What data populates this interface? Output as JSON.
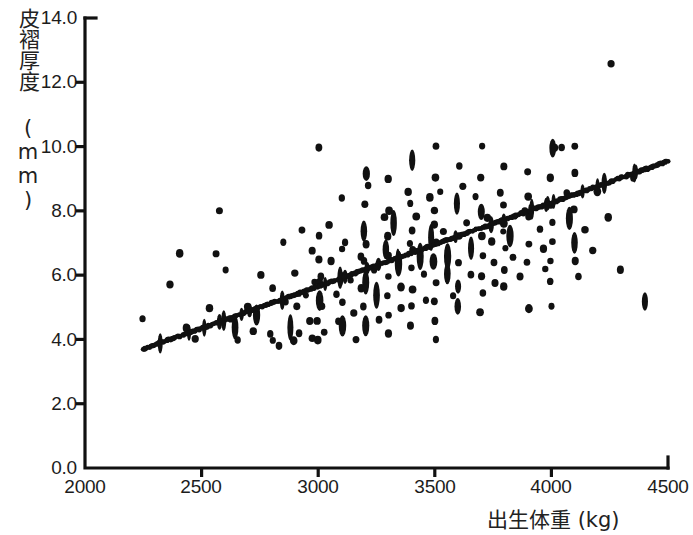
{
  "chart_data": {
    "type": "scatter",
    "title": "",
    "subtitle": "",
    "xlabel": "出生体重 (kg)",
    "ylabel": "皮褶厚度 (mm)",
    "xlim": [
      2000,
      4500
    ],
    "ylim": [
      0.0,
      14.0
    ],
    "xticks": [
      2000,
      2500,
      3000,
      3500,
      4000,
      4500
    ],
    "xtick_labels": [
      "2000",
      "2500",
      "3000",
      "3500",
      "4000",
      "4500"
    ],
    "yticks": [
      0.0,
      2.0,
      4.0,
      6.0,
      8.0,
      10.0,
      12.0,
      14.0
    ],
    "ytick_labels": [
      "0.0",
      "2.0",
      "4.0",
      "6.0",
      "8.0",
      "10.0",
      "12.0",
      "14.0"
    ],
    "grid": false,
    "legend": null,
    "marker_color": "#111111",
    "line_color": "#111111",
    "background_color": "#ffffff",
    "axis_color": "#111111",
    "series": [
      {
        "name": "観測値",
        "type": "scatter",
        "points": [
          [
            2250,
            4.6
          ],
          [
            2370,
            5.7
          ],
          [
            2400,
            6.7
          ],
          [
            2430,
            4.4
          ],
          [
            2470,
            4.0
          ],
          [
            2530,
            5.0
          ],
          [
            2560,
            6.7
          ],
          [
            2570,
            8.0
          ],
          [
            2600,
            6.2
          ],
          [
            2620,
            4.6
          ],
          [
            2640,
            4.4
          ],
          [
            2660,
            4.0
          ],
          [
            2700,
            5.0
          ],
          [
            2720,
            4.3
          ],
          [
            2740,
            4.8
          ],
          [
            2760,
            6.0
          ],
          [
            2790,
            4.2
          ],
          [
            2800,
            5.6
          ],
          [
            2810,
            4.0
          ],
          [
            2830,
            3.8
          ],
          [
            2850,
            7.0
          ],
          [
            2860,
            5.2
          ],
          [
            2880,
            4.4
          ],
          [
            2890,
            4.0
          ],
          [
            2900,
            6.1
          ],
          [
            2910,
            5.0
          ],
          [
            2920,
            4.2
          ],
          [
            2930,
            7.4
          ],
          [
            2950,
            5.4
          ],
          [
            2960,
            4.6
          ],
          [
            2970,
            4.0
          ],
          [
            2980,
            6.8
          ],
          [
            2990,
            5.8
          ],
          [
            3000,
            10.0
          ],
          [
            3000,
            7.2
          ],
          [
            3000,
            6.5
          ],
          [
            3000,
            5.8
          ],
          [
            3000,
            5.2
          ],
          [
            3000,
            4.6
          ],
          [
            3000,
            4.0
          ],
          [
            3010,
            6.0
          ],
          [
            3020,
            5.0
          ],
          [
            3030,
            4.2
          ],
          [
            3050,
            7.6
          ],
          [
            3060,
            6.4
          ],
          [
            3080,
            5.4
          ],
          [
            3090,
            4.6
          ],
          [
            3100,
            8.4
          ],
          [
            3100,
            6.8
          ],
          [
            3100,
            6.0
          ],
          [
            3100,
            5.2
          ],
          [
            3110,
            4.4
          ],
          [
            3120,
            7.0
          ],
          [
            3140,
            5.8
          ],
          [
            3150,
            4.8
          ],
          [
            3160,
            4.0
          ],
          [
            3180,
            6.6
          ],
          [
            3190,
            5.6
          ],
          [
            3200,
            9.2
          ],
          [
            3200,
            8.2
          ],
          [
            3200,
            7.4
          ],
          [
            3200,
            7.0
          ],
          [
            3200,
            6.4
          ],
          [
            3200,
            5.8
          ],
          [
            3200,
            5.0
          ],
          [
            3200,
            4.4
          ],
          [
            3220,
            8.8
          ],
          [
            3240,
            6.2
          ],
          [
            3250,
            5.4
          ],
          [
            3260,
            4.6
          ],
          [
            3280,
            7.8
          ],
          [
            3290,
            6.8
          ],
          [
            3300,
            9.0
          ],
          [
            3300,
            8.0
          ],
          [
            3300,
            7.2
          ],
          [
            3300,
            6.6
          ],
          [
            3300,
            6.0
          ],
          [
            3300,
            5.4
          ],
          [
            3300,
            4.8
          ],
          [
            3300,
            4.2
          ],
          [
            3320,
            7.6
          ],
          [
            3340,
            6.4
          ],
          [
            3350,
            5.6
          ],
          [
            3360,
            5.0
          ],
          [
            3380,
            8.6
          ],
          [
            3390,
            7.0
          ],
          [
            3400,
            9.6
          ],
          [
            3400,
            8.2
          ],
          [
            3400,
            7.4
          ],
          [
            3400,
            6.8
          ],
          [
            3400,
            6.2
          ],
          [
            3400,
            5.6
          ],
          [
            3400,
            5.0
          ],
          [
            3400,
            4.4
          ],
          [
            3420,
            7.8
          ],
          [
            3440,
            6.6
          ],
          [
            3450,
            6.0
          ],
          [
            3460,
            5.2
          ],
          [
            3480,
            8.4
          ],
          [
            3490,
            7.2
          ],
          [
            3500,
            10.0
          ],
          [
            3500,
            9.0
          ],
          [
            3500,
            8.0
          ],
          [
            3500,
            7.6
          ],
          [
            3500,
            7.0
          ],
          [
            3500,
            6.4
          ],
          [
            3500,
            5.8
          ],
          [
            3500,
            5.2
          ],
          [
            3500,
            4.6
          ],
          [
            3500,
            4.0
          ],
          [
            3520,
            8.6
          ],
          [
            3540,
            7.4
          ],
          [
            3550,
            6.6
          ],
          [
            3560,
            6.0
          ],
          [
            3580,
            5.4
          ],
          [
            3600,
            9.4
          ],
          [
            3600,
            8.2
          ],
          [
            3600,
            7.2
          ],
          [
            3600,
            6.4
          ],
          [
            3600,
            5.6
          ],
          [
            3600,
            5.0
          ],
          [
            3620,
            8.8
          ],
          [
            3640,
            7.6
          ],
          [
            3650,
            6.8
          ],
          [
            3660,
            6.0
          ],
          [
            3680,
            8.4
          ],
          [
            3700,
            10.0
          ],
          [
            3700,
            9.0
          ],
          [
            3700,
            8.0
          ],
          [
            3700,
            7.2
          ],
          [
            3700,
            6.6
          ],
          [
            3700,
            6.0
          ],
          [
            3700,
            5.4
          ],
          [
            3700,
            4.8
          ],
          [
            3720,
            7.8
          ],
          [
            3740,
            7.0
          ],
          [
            3750,
            6.4
          ],
          [
            3760,
            5.8
          ],
          [
            3780,
            8.6
          ],
          [
            3790,
            7.4
          ],
          [
            3800,
            9.4
          ],
          [
            3800,
            8.2
          ],
          [
            3800,
            7.6
          ],
          [
            3800,
            6.8
          ],
          [
            3800,
            6.2
          ],
          [
            3800,
            5.6
          ],
          [
            3820,
            7.2
          ],
          [
            3840,
            6.6
          ],
          [
            3860,
            6.0
          ],
          [
            3880,
            8.0
          ],
          [
            3900,
            9.2
          ],
          [
            3900,
            8.4
          ],
          [
            3900,
            7.8
          ],
          [
            3900,
            7.0
          ],
          [
            3900,
            6.4
          ],
          [
            3900,
            5.0
          ],
          [
            3950,
            7.4
          ],
          [
            3960,
            6.8
          ],
          [
            3980,
            6.2
          ],
          [
            4000,
            10.0
          ],
          [
            4000,
            9.0
          ],
          [
            4000,
            8.2
          ],
          [
            4000,
            7.6
          ],
          [
            4000,
            7.0
          ],
          [
            4000,
            6.4
          ],
          [
            4000,
            5.8
          ],
          [
            4000,
            5.0
          ],
          [
            4020,
            10.0
          ],
          [
            4050,
            10.0
          ],
          [
            4060,
            8.6
          ],
          [
            4080,
            7.8
          ],
          [
            4100,
            10.0
          ],
          [
            4100,
            9.2
          ],
          [
            4100,
            8.0
          ],
          [
            4100,
            7.0
          ],
          [
            4100,
            6.4
          ],
          [
            4120,
            6.0
          ],
          [
            4150,
            7.4
          ],
          [
            4180,
            6.8
          ],
          [
            4200,
            8.6
          ],
          [
            4250,
            12.6
          ],
          [
            4250,
            7.8
          ],
          [
            4300,
            6.2
          ],
          [
            4350,
            9.0
          ],
          [
            4400,
            5.2
          ]
        ]
      },
      {
        "name": "回帰直線",
        "type": "line",
        "x": [
          2250,
          4500
        ],
        "y": [
          3.7,
          9.55
        ],
        "slope": 0.0026,
        "intercept": -2.15
      }
    ]
  }
}
